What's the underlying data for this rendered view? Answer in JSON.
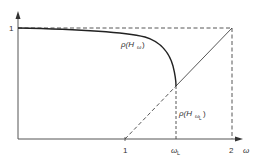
{
  "diagram": {
    "y_tick_label": "1",
    "x_tick_labels": {
      "one": "1",
      "omega_l_main": "ω",
      "omega_l_sub": "L",
      "two": "2"
    },
    "x_axis_label": "ω",
    "curve_label": {
      "rho": "ρ(H",
      "sub": "ω",
      "close": ")"
    },
    "point_label": {
      "rho": "ρ(H",
      "sub": "ω",
      "subsub": "L",
      "close": ")"
    },
    "colors": {
      "stroke": "#333333",
      "background": "#ffffff"
    }
  }
}
